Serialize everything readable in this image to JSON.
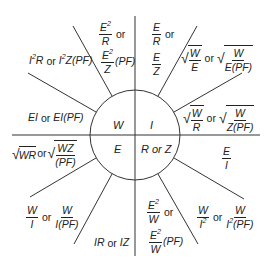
{
  "center": {
    "W": "W",
    "I": "I",
    "E": "E",
    "RZ": "R or Z"
  },
  "formulas": {
    "w_from_I2R": {
      "text": "I2R or I2Z(PF)",
      "a": "I",
      "b": "R",
      "or": "or",
      "c": "I",
      "d": "Z(PF)"
    },
    "w_from_E2R": {
      "num1": "E",
      "den1": "R",
      "or": "or",
      "num2": "E",
      "den2": "Z",
      "suffix": "(PF)"
    },
    "w_from_EI": {
      "text": "EI or EI(PF)",
      "a": "EI",
      "or": "or",
      "b": "EI(PF)"
    },
    "i_from_ER": {
      "num1": "E",
      "den1": "R",
      "or": "or",
      "num2": "E",
      "den2": "Z"
    },
    "i_from_WE": {
      "num1": "W",
      "den1": "E",
      "or": "or",
      "num2": "W",
      "den2": "E(PF)"
    },
    "i_from_WR": {
      "num1": "W",
      "den1": "R",
      "or": "or",
      "num2": "W",
      "den2": "Z(PF)"
    },
    "e_from_WR": {
      "a": "WR",
      "or": "or",
      "num2": "WZ",
      "den2": "(PF)"
    },
    "e_from_WI": {
      "num1": "W",
      "den1": "I",
      "or": "or",
      "num2": "W",
      "den2": "I(PF)"
    },
    "e_from_IR": {
      "text": "IR or IZ",
      "a": "IR",
      "or": "or",
      "b": "IZ"
    },
    "r_from_EI": {
      "num": "E",
      "den": "I"
    },
    "r_from_WI2": {
      "num1": "W",
      "den1": "I",
      "or": "or",
      "num2": "W",
      "den2a": "I",
      "den2b": "(PF)"
    },
    "r_from_E2W": {
      "num1": "E",
      "den1": "W",
      "or": "or",
      "num2": "E",
      "den2": "W",
      "suffix": "(PF)"
    }
  },
  "colors": {
    "line": "#333333",
    "text": "#222222",
    "background": "#ffffff"
  }
}
